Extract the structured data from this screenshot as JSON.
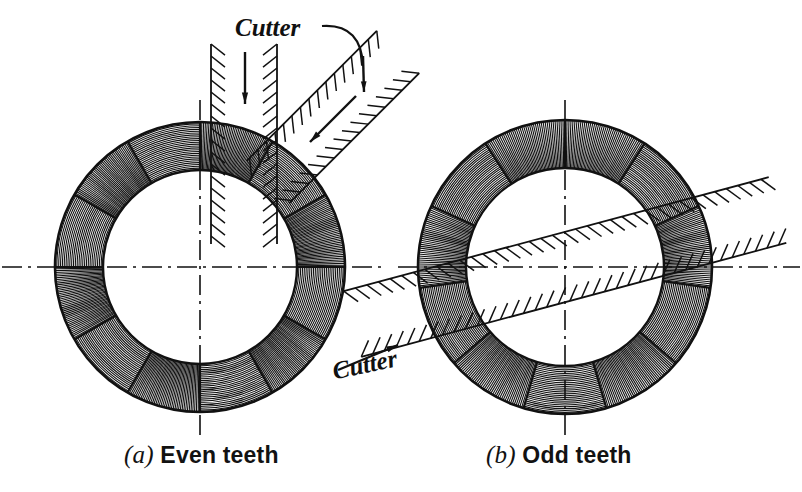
{
  "figure": {
    "background_color": "#ffffff",
    "ink_color": "#111111",
    "width": 802,
    "height": 492
  },
  "panels": [
    {
      "id": "a",
      "label": "(a)",
      "label_letter": "a",
      "caption": "Even teeth",
      "center": {
        "x": 200,
        "y": 267
      },
      "outer_radius": 145,
      "inner_radius": 97,
      "sector_count": 12,
      "sector_start_angle_deg": 0,
      "hatch_alternates": true,
      "centerlines": {
        "horizontal": true,
        "vertical": true,
        "style": "dash-dot"
      },
      "cutters": [
        {
          "name": "vertical-cutter",
          "orientation_deg": 90,
          "band_left_x": 211,
          "band_right_x": 277,
          "arrow": "down",
          "arrow_x": 245
        },
        {
          "name": "diagonal-cutter",
          "orientation_deg": -45,
          "arrow": "down-left"
        }
      ],
      "cutter_label": "Cutter"
    },
    {
      "id": "b",
      "label": "(b)",
      "label_letter": "b",
      "caption": "Odd teeth",
      "center": {
        "x": 565,
        "y": 267
      },
      "outer_radius": 147,
      "inner_radius": 99,
      "sector_count": 11,
      "sector_start_angle_deg": 90,
      "hatch_alternates": true,
      "centerlines": {
        "horizontal": true,
        "vertical": true,
        "style": "dash-dot"
      },
      "cutters": [
        {
          "name": "diagonal-cutter",
          "orientation_deg": -15,
          "passes_through_center": true,
          "arrow": "up-right"
        }
      ],
      "cutter_label": "Cutter"
    }
  ],
  "labels": {
    "cutter_a": "Cutter",
    "cutter_b": "Cutter",
    "caption_a_mark": "(a)",
    "caption_a_text": "Even teeth",
    "caption_b_mark": "(b)",
    "caption_b_text": "Odd teeth"
  }
}
